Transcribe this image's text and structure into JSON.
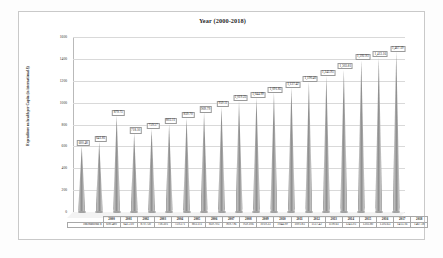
{
  "chart_data": {
    "type": "bar",
    "title": "Year (2000-2018)",
    "xlabel": "",
    "ylabel": "Expenditure on health per Capita (in international $)",
    "ylim": [
      0,
      1600
    ],
    "ytick_labels": [
      "1600",
      "1400",
      "1200",
      "1000",
      "800",
      "600",
      "400",
      "200",
      "0"
    ],
    "grid": true,
    "legend": "none",
    "series_name": "International $",
    "categories": [
      "2000",
      "2001",
      "2002",
      "2003",
      "2004",
      "2005",
      "2006",
      "2007",
      "2008",
      "2009",
      "2010",
      "2011",
      "2012",
      "2013",
      "2014",
      "2015",
      "2016",
      "2017",
      "2018"
    ],
    "values": [
      600.48,
      641.81,
      879.75,
      718.1,
      759.57,
      803.11,
      859.7,
      909.79,
      959.11,
      1019.23,
      1044.99,
      1091.85,
      1137.42,
      1190.4,
      1245.95,
      1303.81,
      1392.93,
      1413.16,
      1467.19
    ],
    "data_labels": [
      "600.48",
      "641.81",
      "879.75",
      "718.10",
      "759.57",
      "803.11",
      "859.70",
      "909.79",
      "959.11",
      "1,019.23",
      "1,044.99",
      "1,091.85",
      "1,137.42",
      "1,190.40",
      "1,245.95",
      "1,303.81",
      "1,392.93",
      "1,413.16",
      "1,467.19"
    ],
    "table_values": [
      "600.480",
      "641.310",
      "879.750",
      "718.501",
      "759.571",
      "803.111",
      "859.705",
      "909.796",
      "959.106",
      "1019.23",
      "1044.99",
      "1091.85",
      "1137.42",
      "1190.61",
      "1245.93",
      "1303.80",
      "1392.63",
      "1413.16",
      "1467.18"
    ]
  }
}
